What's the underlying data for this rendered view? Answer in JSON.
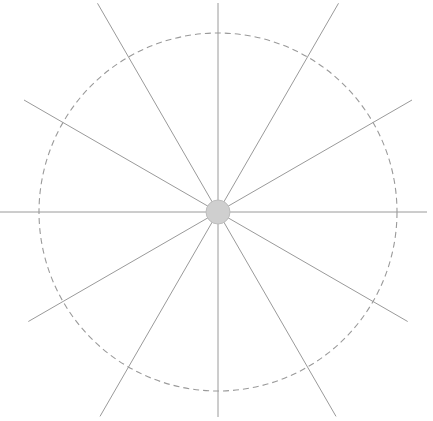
{
  "figure": {
    "width": 433,
    "height": 421,
    "background_color": "#ffffff"
  },
  "chart_data": {
    "type": "scatter",
    "subtitle": "",
    "xlabel": "",
    "ylabel": "",
    "grid": false,
    "legend": "none",
    "xlim": [
      0,
      433
    ],
    "ylim": [
      0,
      421
    ],
    "center": {
      "x": 218,
      "y": 212
    },
    "hub": {
      "radius": 12,
      "fill_color": "#cfcfcf",
      "stroke_color": "#bdbdbd",
      "stroke_width": 1
    },
    "dashed_circle": {
      "radius": 179,
      "stroke_color": "#9a9a9a",
      "stroke_width": 1.1,
      "dash_length": 6,
      "gap_length": 4
    },
    "spokes": {
      "count": 12,
      "angle_step_degrees": 30,
      "stroke_color": "#9a9a9a",
      "stroke_width": 1,
      "angles_degrees": [
        0,
        30,
        60,
        90,
        120,
        150,
        180,
        210,
        240,
        270,
        300,
        330
      ],
      "lengths": [
        209,
        219,
        236,
        205,
        236,
        219,
        218,
        224,
        241,
        209,
        241,
        224
      ]
    }
  }
}
